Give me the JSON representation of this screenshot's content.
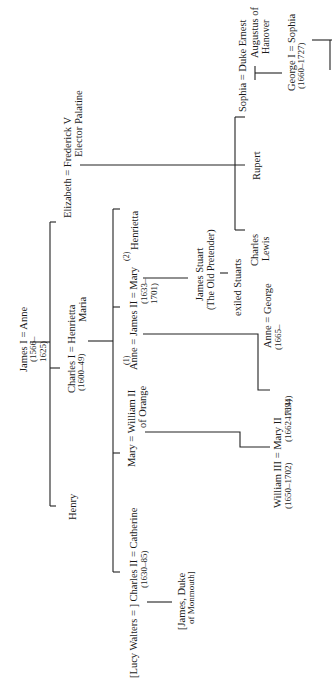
{
  "diagram": {
    "type": "family-tree",
    "orientation": "rotated -90deg (reads bottom-to-top)",
    "nodes": {
      "james_i": {
        "name": "James I = Anne",
        "dates": "(1566–",
        "dates2": "1625)"
      },
      "charles_i": {
        "name": "Charles I = Henrietta",
        "name2": "Maria",
        "dates": "(1600–49)"
      },
      "henry": {
        "name": "Henry"
      },
      "elizabeth": {
        "name": "Elizabeth = Frederick V",
        "name2": "Elector Palatine"
      },
      "lucy_charles_ii": {
        "name": "[Lucy Walters = ] Charles II = Catherine",
        "dates": "(1630–85)"
      },
      "monmouth": {
        "name": "[James, Duke",
        "name2": "of Monmouth]"
      },
      "mary_william_ii": {
        "name": "Mary = William II",
        "name2": "of Orange"
      },
      "james_ii": {
        "marker1": "(1)",
        "marker2": "(2)",
        "name": "Anne = James II = Mary",
        "dates": "(1633–",
        "dates2": "1701)"
      },
      "henrietta": {
        "name": "Henrietta"
      },
      "james_stuart": {
        "name": "James Stuart",
        "name2": "(The Old Pretender)"
      },
      "exiled": {
        "name": "exiled Stuarts"
      },
      "william_iii": {
        "name": "William III = Mary II",
        "dates": "(1650–1702)",
        "dates2": "(1662–1694)"
      },
      "anne_george": {
        "name": "Anne = George",
        "dates": "(1665–",
        "dates2": "1714)"
      },
      "charles_lewis": {
        "name": "Charles",
        "name2": "Lewis"
      },
      "rupert": {
        "name": "Rupert"
      },
      "sophia": {
        "name": "Sophia = Duke Ernest",
        "name2": "Augustus of",
        "name3": "Hanover"
      },
      "george_i": {
        "name": "George I = Sophia",
        "dates": "(1660–1727)"
      }
    }
  }
}
